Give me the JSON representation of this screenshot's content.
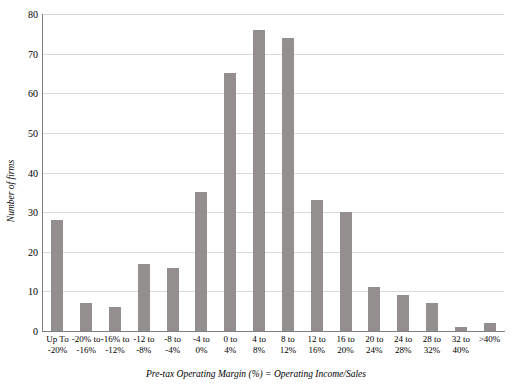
{
  "chart_data": {
    "type": "bar",
    "title": "",
    "xlabel": "Pre-tax Operating Margin (%) = Operating Income/Sales",
    "ylabel": "Number of firms",
    "ylim": [
      0,
      80
    ],
    "yticks": [
      0,
      10,
      20,
      30,
      40,
      50,
      60,
      70,
      80
    ],
    "grid": true,
    "legend": "none",
    "bar_color": "#938f8e",
    "categories": [
      "Up To -20%",
      "-20% to -16%",
      "-16% to -12%",
      "-12 to -8%",
      "-8 to -4%",
      "-4 to 0%",
      "0 to 4%",
      "4 to 8%",
      "8 to 12%",
      "12 to 16%",
      "16 to 20%",
      "20 to 24%",
      "24 to 28%",
      "28 to 32%",
      "32 to 40%",
      ">40%"
    ],
    "category_lines": [
      [
        "Up To",
        "-20%"
      ],
      [
        "-20% to",
        "-16%"
      ],
      [
        "-16% to",
        "-12%"
      ],
      [
        "-12 to",
        "-8%"
      ],
      [
        "-8 to",
        "-4%"
      ],
      [
        "-4 to",
        "0%"
      ],
      [
        "0 to",
        "4%"
      ],
      [
        "4 to",
        "8%"
      ],
      [
        "8 to",
        "12%"
      ],
      [
        "12 to",
        "16%"
      ],
      [
        "16 to",
        "20%"
      ],
      [
        "20 to",
        "24%"
      ],
      [
        "24 to",
        "28%"
      ],
      [
        "28 to",
        "32%"
      ],
      [
        "32 to",
        "40%"
      ],
      [
        ">40%",
        ""
      ]
    ],
    "values": [
      28,
      7,
      6,
      17,
      16,
      35,
      65,
      76,
      74,
      33,
      30,
      11,
      9,
      7,
      1,
      2
    ]
  }
}
